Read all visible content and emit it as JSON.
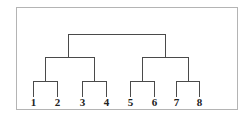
{
  "diagram": {
    "type": "dendrogram",
    "frame": {
      "x": 16,
      "y": 7,
      "width": 221,
      "height": 102,
      "color": "#b4b4b4"
    },
    "line_color": "#4a4a4a",
    "label_color": "#222222",
    "leaves": [
      {
        "id": "1",
        "label": "1",
        "x": 33
      },
      {
        "id": "2",
        "label": "2",
        "x": 57
      },
      {
        "id": "3",
        "label": "3",
        "x": 82
      },
      {
        "id": "4",
        "label": "4",
        "x": 106
      },
      {
        "id": "5",
        "label": "5",
        "x": 130
      },
      {
        "id": "6",
        "label": "6",
        "x": 154
      },
      {
        "id": "7",
        "label": "7",
        "x": 176
      },
      {
        "id": "8",
        "label": "8",
        "x": 199
      }
    ],
    "leaf_line_bottom_y": 97,
    "label_baseline_y": 106,
    "merges": [
      {
        "name": "merge-1-2",
        "left": 33,
        "right": 57,
        "y": 81,
        "left_from": 97,
        "right_from": 97
      },
      {
        "name": "merge-3-4",
        "left": 82,
        "right": 106,
        "y": 81,
        "left_from": 97,
        "right_from": 97
      },
      {
        "name": "merge-5-6",
        "left": 130,
        "right": 154,
        "y": 81,
        "left_from": 97,
        "right_from": 97
      },
      {
        "name": "merge-7-8",
        "left": 176,
        "right": 199,
        "y": 81,
        "left_from": 97,
        "right_from": 97
      },
      {
        "name": "merge-12-34",
        "left": 45,
        "right": 94,
        "y": 57,
        "left_from": 81,
        "right_from": 81
      },
      {
        "name": "merge-56-78",
        "left": 142,
        "right": 188,
        "y": 57,
        "left_from": 81,
        "right_from": 81
      },
      {
        "name": "merge-root",
        "left": 68,
        "right": 165,
        "y": 34,
        "left_from": 57,
        "right_from": 57
      }
    ]
  }
}
